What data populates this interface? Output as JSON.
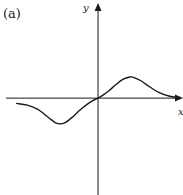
{
  "chart_data": {
    "type": "line",
    "title": "",
    "panel_label": "(a)",
    "xlabel": "x",
    "ylabel": "y",
    "ticks": "none",
    "grid": false,
    "legend": "none",
    "xlim": [
      -2.6,
      2.4
    ],
    "ylim": [
      -2.75,
      2.7
    ],
    "series": [
      {
        "name": "curve",
        "description": "odd wave: dips to a minimum left of origin, passes through origin, rises to a maximum right of origin, decays toward axis",
        "x": [
          -2.3,
          -2.0,
          -1.7,
          -1.4,
          -1.2,
          -1.05,
          -0.9,
          -0.7,
          -0.5,
          -0.3,
          -0.15,
          0,
          0.15,
          0.3,
          0.5,
          0.7,
          0.9,
          1.0,
          1.2,
          1.4,
          1.7,
          2.0,
          2.3
        ],
        "y": [
          -0.15,
          -0.2,
          -0.32,
          -0.55,
          -0.7,
          -0.73,
          -0.68,
          -0.52,
          -0.33,
          -0.17,
          -0.07,
          0,
          0.09,
          0.2,
          0.38,
          0.53,
          0.6,
          0.59,
          0.5,
          0.36,
          0.17,
          0.06,
          0.01
        ]
      }
    ],
    "style": {
      "line_color": "#1a1a1a",
      "axis_color": "#1a1a1a"
    }
  }
}
